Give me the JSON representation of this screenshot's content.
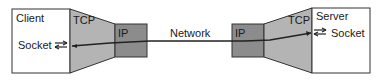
{
  "diagram": {
    "client": {
      "label": "Client",
      "socket_label": "Socket"
    },
    "server": {
      "label": "Server",
      "socket_label": "Socket"
    },
    "left_tcp": {
      "label": "TCP"
    },
    "left_ip": {
      "label": "IP"
    },
    "right_tcp": {
      "label": "TCP"
    },
    "right_ip": {
      "label": "IP"
    },
    "network": {
      "label": "Network"
    },
    "icons": {
      "socket_bidirectional": "bidirectional-arrows-icon",
      "connection_arrowhead": "arrowhead"
    },
    "colors": {
      "box_fill": "#ffffff",
      "tcp_fill": "#b4b4b4",
      "ip_fill": "#8c8c8c",
      "stroke": "#333333"
    }
  }
}
